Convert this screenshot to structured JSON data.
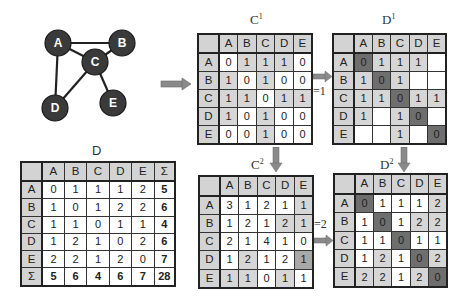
{
  "graph": {
    "nodes": [
      {
        "id": "A",
        "label": "A",
        "x": 58,
        "y": 43
      },
      {
        "id": "B",
        "label": "B",
        "x": 122,
        "y": 43
      },
      {
        "id": "C",
        "label": "C",
        "x": 95,
        "y": 62
      },
      {
        "id": "D",
        "label": "D",
        "x": 55,
        "y": 108
      },
      {
        "id": "E",
        "label": "E",
        "x": 113,
        "y": 103
      }
    ],
    "edges": [
      [
        "A",
        "B"
      ],
      [
        "A",
        "C"
      ],
      [
        "A",
        "D"
      ],
      [
        "B",
        "C"
      ],
      [
        "C",
        "D"
      ],
      [
        "C",
        "E"
      ]
    ],
    "node_color": "#3a3a3a",
    "node_text_color": "#ffffff"
  },
  "labels": {
    "c1_title": "C",
    "c1_sup": "1",
    "d1_title": "D",
    "d1_sup": "1",
    "c2_title": "C",
    "c2_sup": "2",
    "d2_title": "D",
    "d2_sup": "2",
    "d_title": "D",
    "eq1": "=1",
    "eq2": "=2"
  },
  "matrices": {
    "C1": {
      "headers": [
        "A",
        "B",
        "C",
        "D",
        "E"
      ],
      "rows": [
        {
          "label": "A",
          "values": [
            "0",
            "1",
            "1",
            "1",
            "0"
          ]
        },
        {
          "label": "B",
          "values": [
            "1",
            "0",
            "1",
            "0",
            "0"
          ]
        },
        {
          "label": "C",
          "values": [
            "1",
            "1",
            "0",
            "1",
            "1"
          ]
        },
        {
          "label": "D",
          "values": [
            "1",
            "0",
            "1",
            "0",
            "0"
          ]
        },
        {
          "label": "E",
          "values": [
            "0",
            "0",
            "1",
            "0",
            "0"
          ]
        }
      ]
    },
    "D1": {
      "headers": [
        "A",
        "B",
        "C",
        "D",
        "E"
      ],
      "rows": [
        {
          "label": "A",
          "values": [
            "0",
            "1",
            "1",
            "1",
            ""
          ]
        },
        {
          "label": "B",
          "values": [
            "1",
            "0",
            "1",
            "",
            ""
          ]
        },
        {
          "label": "C",
          "values": [
            "1",
            "1",
            "0",
            "1",
            "1"
          ]
        },
        {
          "label": "D",
          "values": [
            "1",
            "",
            "1",
            "0",
            ""
          ]
        },
        {
          "label": "E",
          "values": [
            "",
            "",
            "1",
            "",
            "0"
          ]
        }
      ]
    },
    "C2": {
      "headers": [
        "A",
        "B",
        "C",
        "D",
        "E"
      ],
      "rows": [
        {
          "label": "A",
          "values": [
            "3",
            "1",
            "2",
            "1",
            "1"
          ]
        },
        {
          "label": "B",
          "values": [
            "1",
            "2",
            "1",
            "2",
            "1"
          ]
        },
        {
          "label": "C",
          "values": [
            "2",
            "1",
            "4",
            "1",
            "0"
          ]
        },
        {
          "label": "D",
          "values": [
            "1",
            "2",
            "1",
            "2",
            "1"
          ]
        },
        {
          "label": "E",
          "values": [
            "1",
            "1",
            "0",
            "1",
            "1"
          ]
        }
      ]
    },
    "D2": {
      "headers": [
        "A",
        "B",
        "C",
        "D",
        "E"
      ],
      "rows": [
        {
          "label": "A",
          "values": [
            "0",
            "1",
            "1",
            "1",
            "2"
          ]
        },
        {
          "label": "B",
          "values": [
            "1",
            "0",
            "1",
            "2",
            "2"
          ]
        },
        {
          "label": "C",
          "values": [
            "1",
            "1",
            "0",
            "1",
            "1"
          ]
        },
        {
          "label": "D",
          "values": [
            "1",
            "2",
            "1",
            "0",
            "2"
          ]
        },
        {
          "label": "E",
          "values": [
            "2",
            "2",
            "1",
            "2",
            "0"
          ]
        }
      ]
    },
    "D": {
      "headers": [
        "A",
        "B",
        "C",
        "D",
        "E",
        "Σ"
      ],
      "rows": [
        {
          "label": "A",
          "values": [
            "0",
            "1",
            "1",
            "1",
            "2",
            "5"
          ]
        },
        {
          "label": "B",
          "values": [
            "1",
            "0",
            "1",
            "2",
            "2",
            "6"
          ]
        },
        {
          "label": "C",
          "values": [
            "1",
            "1",
            "0",
            "1",
            "1",
            "4"
          ]
        },
        {
          "label": "D",
          "values": [
            "1",
            "2",
            "1",
            "0",
            "2",
            "6"
          ]
        },
        {
          "label": "E",
          "values": [
            "2",
            "2",
            "1",
            "2",
            "0",
            "7"
          ]
        },
        {
          "label": "Σ",
          "values": [
            "5",
            "6",
            "4",
            "6",
            "7",
            "28"
          ]
        }
      ]
    }
  },
  "colors": {
    "header": "#d3d3d3",
    "light_shade": "#d6d6d6",
    "dark_shade": "#6e6e6e",
    "arrow": "#8a8a8a"
  }
}
